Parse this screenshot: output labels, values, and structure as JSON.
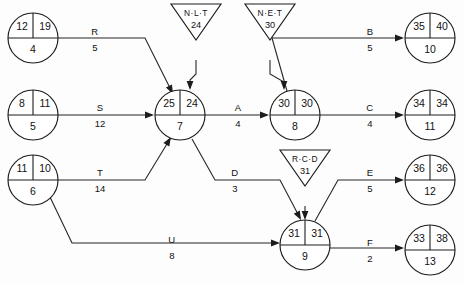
{
  "diagram": {
    "type": "network-diagram",
    "ink_color": "#1c1c1c",
    "background_color": "#fdfdfd"
  },
  "nodes": [
    {
      "id": "4",
      "early": "12",
      "late": "19",
      "cx": 33,
      "cy": 38,
      "r": 25
    },
    {
      "id": "5",
      "early": "8",
      "late": "11",
      "cx": 33,
      "cy": 115,
      "r": 25
    },
    {
      "id": "6",
      "early": "11",
      "late": "10",
      "cx": 33,
      "cy": 180,
      "r": 25
    },
    {
      "id": "7",
      "early": "25",
      "late": "24",
      "cx": 180,
      "cy": 115,
      "r": 25
    },
    {
      "id": "8",
      "early": "30",
      "late": "30",
      "cx": 295,
      "cy": 115,
      "r": 25
    },
    {
      "id": "9",
      "early": "31",
      "late": "31",
      "cx": 305,
      "cy": 245,
      "r": 25
    },
    {
      "id": "10",
      "early": "35",
      "late": "40",
      "cx": 430,
      "cy": 38,
      "r": 25
    },
    {
      "id": "11",
      "early": "34",
      "late": "34",
      "cx": 430,
      "cy": 115,
      "r": 25
    },
    {
      "id": "12",
      "early": "36",
      "late": "36",
      "cx": 430,
      "cy": 180,
      "r": 25
    },
    {
      "id": "13",
      "early": "33",
      "late": "38",
      "cx": 430,
      "cy": 250,
      "r": 25
    }
  ],
  "constraints": [
    {
      "name": "N·L·T",
      "value": "24",
      "cx": 196,
      "cy": 22,
      "half_w": 25,
      "height": 36,
      "target": "7"
    },
    {
      "name": "N·E·T",
      "value": "30",
      "cx": 270,
      "cy": 22,
      "half_w": 25,
      "height": 36,
      "target": "8"
    },
    {
      "name": "R·C·D",
      "value": "31",
      "cx": 305,
      "cy": 168,
      "half_w": 25,
      "height": 36,
      "target": "9"
    }
  ],
  "activities": [
    {
      "label": "R",
      "duration": "5",
      "from": "4",
      "to": "7",
      "lx": 95,
      "ly": 32,
      "dx": 95,
      "dy": 48
    },
    {
      "label": "S",
      "duration": "12",
      "from": "5",
      "to": "7",
      "lx": 100,
      "ly": 108,
      "dx": 100,
      "dy": 124
    },
    {
      "label": "T",
      "duration": "14",
      "from": "6",
      "to": "7",
      "lx": 100,
      "ly": 173,
      "dx": 100,
      "dy": 189
    },
    {
      "label": "U",
      "duration": "8",
      "from": "6",
      "to": "9",
      "lx": 172,
      "ly": 240,
      "dx": 172,
      "dy": 256
    },
    {
      "label": "A",
      "duration": "4",
      "from": "7",
      "to": "8",
      "lx": 238,
      "ly": 108,
      "dx": 238,
      "dy": 124
    },
    {
      "label": "D",
      "duration": "3",
      "from": "7",
      "to": "9",
      "lx": 235,
      "ly": 173,
      "dx": 235,
      "dy": 189
    },
    {
      "label": "B",
      "duration": "5",
      "from": "8",
      "to": "10",
      "lx": 370,
      "ly": 32,
      "dx": 370,
      "dy": 48
    },
    {
      "label": "C",
      "duration": "4",
      "from": "8",
      "to": "11",
      "lx": 370,
      "ly": 108,
      "dx": 370,
      "dy": 124
    },
    {
      "label": "E",
      "duration": "5",
      "from": "9",
      "to": "12",
      "lx": 370,
      "ly": 173,
      "dx": 370,
      "dy": 189
    },
    {
      "label": "F",
      "duration": "2",
      "from": "9",
      "to": "13",
      "lx": 370,
      "ly": 243,
      "dx": 370,
      "dy": 259
    }
  ],
  "edges": [
    {
      "name": "edge-4-7",
      "d": "M 58 38 L 145 38 L 172 92"
    },
    {
      "name": "edge-5-7",
      "d": "M 58 115 L 152 115"
    },
    {
      "name": "edge-6-7",
      "d": "M 58 180 L 145 180 L 170 139"
    },
    {
      "name": "edge-6-9",
      "d": "M 50 197 L 72 243 L 278 243"
    },
    {
      "name": "edge-7-8",
      "d": "M 205 115 L 267 115"
    },
    {
      "name": "edge-7-9",
      "d": "M 192 139 L 215 180 L 280 180 L 300 218"
    },
    {
      "name": "edge-8-10",
      "d": "M 287 91 L 272 38 L 402 38"
    },
    {
      "name": "edge-8-11",
      "d": "M 320 115 L 402 115"
    },
    {
      "name": "edge-9-12",
      "d": "M 315 221 L 338 180 L 402 180"
    },
    {
      "name": "edge-9-13",
      "d": "M 330 248 L 402 248"
    },
    {
      "name": "link-nlt-7",
      "d": "M 196 60 L 196 74 L 190 80 L 190 88"
    },
    {
      "name": "link-net-8",
      "d": "M 270 60 L 270 74 L 284 82 L 284 88"
    },
    {
      "name": "link-rcd-9",
      "d": "M 305 206 L 305 218"
    }
  ],
  "arrowheads": [
    {
      "name": "arrow-into-7-from-4",
      "x": 173,
      "y": 94,
      "angle": 63
    },
    {
      "name": "arrow-into-7-from-5",
      "x": 154,
      "y": 115,
      "angle": 0
    },
    {
      "name": "arrow-into-7-from-6",
      "x": 171,
      "y": 137,
      "angle": -59
    },
    {
      "name": "arrow-into-7-from-nlt",
      "x": 190,
      "y": 90,
      "angle": 90
    },
    {
      "name": "arrow-into-8-from-7",
      "x": 269,
      "y": 115,
      "angle": 0
    },
    {
      "name": "arrow-into-8-from-net",
      "x": 284,
      "y": 90,
      "angle": 90
    },
    {
      "name": "arrow-into-9-from-7",
      "x": 301,
      "y": 220,
      "angle": 62
    },
    {
      "name": "arrow-into-9-from-6",
      "x": 280,
      "y": 243,
      "angle": 0
    },
    {
      "name": "arrow-into-9-from-rcd",
      "x": 305,
      "y": 220,
      "angle": 90
    },
    {
      "name": "arrow-into-10",
      "x": 404,
      "y": 38,
      "angle": 0
    },
    {
      "name": "arrow-into-11",
      "x": 404,
      "y": 115,
      "angle": 0
    },
    {
      "name": "arrow-into-12",
      "x": 404,
      "y": 180,
      "angle": 0
    },
    {
      "name": "arrow-into-13",
      "x": 404,
      "y": 248,
      "angle": 0
    }
  ]
}
